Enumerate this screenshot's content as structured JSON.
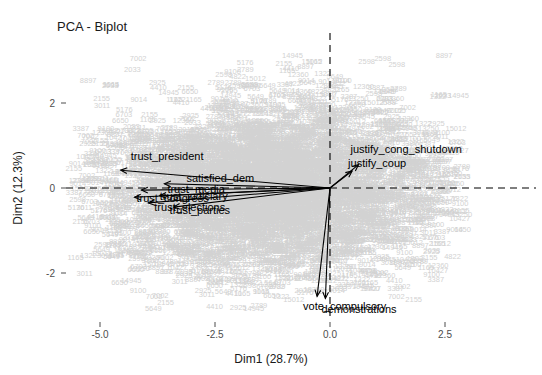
{
  "chart_data": {
    "type": "scatter",
    "title": "PCA - Biplot",
    "xlabel": "Dim1 (28.7%)",
    "ylabel": "Dim2 (12.3%)",
    "xlim": [
      -6.2,
      3.6
    ],
    "ylim": [
      -3.4,
      3.6
    ],
    "xticks": [
      "-5.0",
      "-2.5",
      "0.0",
      "2.5"
    ],
    "xtick_values": [
      -5.0,
      -2.5,
      0.0,
      2.5
    ],
    "yticks": [
      "2",
      "0",
      "-2"
    ],
    "ytick_values": [
      2,
      0,
      -2
    ],
    "grid": false,
    "legend": "none",
    "reference_lines": {
      "horizontal": 0,
      "vertical": 0,
      "style": "dashed",
      "color": "#000000"
    },
    "individuals": {
      "description": "Dense cloud of light grey row-number labels representing individual observations",
      "color": "#d2d2d2",
      "approx_count": 4200,
      "x_range": [
        -5.6,
        2.9
      ],
      "y_range": [
        -2.9,
        3.2
      ],
      "sample_ids": [
        "2925",
        "1165",
        "5649",
        "14945",
        "2033",
        "9100",
        "13250",
        "1322",
        "5176",
        "2155",
        "7002",
        "2598",
        "8897",
        "6703",
        "3011",
        "4822",
        "9014",
        "12360",
        "2789",
        "6650",
        "10427",
        "3387",
        "15012",
        "4410"
      ]
    },
    "variables": {
      "description": "Variable loading arrows emanating from the origin",
      "color": "#000000",
      "arrows": [
        {
          "label": "trust_president",
          "x": -4.55,
          "y": 0.42
        },
        {
          "label": "satisfied_dem",
          "x": -3.6,
          "y": 0.1
        },
        {
          "label": "trust_media",
          "x": -4.1,
          "y": -0.05
        },
        {
          "label": "trust_congress",
          "x": -4.25,
          "y": -0.22
        },
        {
          "label": "trust_elections",
          "x": -3.95,
          "y": -0.35
        },
        {
          "label": "trust_judiciary",
          "x": -3.7,
          "y": -0.18
        },
        {
          "label": "trust_parties",
          "x": -3.4,
          "y": -0.45
        },
        {
          "label": "justify_cong_shutdown",
          "x": 0.62,
          "y": 0.55
        },
        {
          "label": "justify_coup",
          "x": 0.48,
          "y": 0.4
        },
        {
          "label": "vote_compulsory",
          "x": -0.28,
          "y": -2.55
        },
        {
          "label": "demonstrations",
          "x": -0.1,
          "y": -2.6
        }
      ]
    }
  }
}
